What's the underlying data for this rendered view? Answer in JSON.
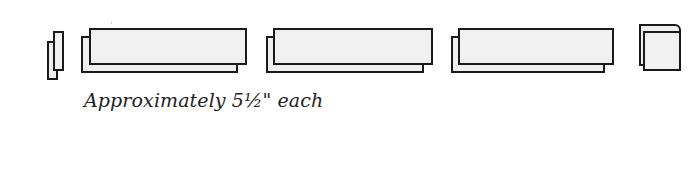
{
  "diagram": {
    "caption": "Approximately 5½\" each",
    "colors": {
      "outline": "#1a1a1a",
      "fill": "#f0f0f0",
      "background": "#ffffff",
      "caption": "#222222"
    },
    "pieces": [
      {
        "name": "small-end-piece",
        "back": {
          "x": 47,
          "y": 41,
          "w": 11,
          "h": 39
        },
        "front": {
          "x": 53,
          "y": 31,
          "w": 11,
          "h": 40
        }
      },
      {
        "name": "long-panel-1",
        "back": {
          "x": 81,
          "y": 36,
          "w": 157,
          "h": 37
        },
        "front": {
          "x": 89,
          "y": 28,
          "w": 158,
          "h": 37
        }
      },
      {
        "name": "long-panel-2",
        "back": {
          "x": 266,
          "y": 36,
          "w": 158,
          "h": 37
        },
        "front": {
          "x": 273,
          "y": 28,
          "w": 160,
          "h": 37
        }
      },
      {
        "name": "long-panel-3",
        "back": {
          "x": 451,
          "y": 36,
          "w": 154,
          "h": 37
        },
        "front": {
          "x": 458,
          "y": 28,
          "w": 156,
          "h": 37
        }
      },
      {
        "name": "square-end-piece",
        "back": {
          "x": 639,
          "y": 24,
          "w": 42,
          "h": 42
        },
        "front": {
          "x": 643,
          "y": 31,
          "w": 38,
          "h": 40
        }
      }
    ]
  }
}
